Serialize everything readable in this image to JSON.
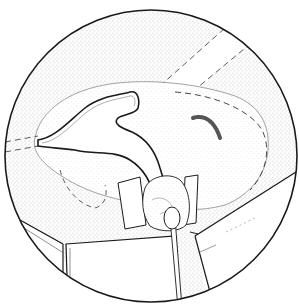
{
  "figure": {
    "type": "surgical-illustration",
    "style": "stippled line drawing in circular field",
    "colors": {
      "background": "#ffffff",
      "line": "#1a1a1a",
      "stipple": "#9a9a9a",
      "dark_mark": "#555555"
    },
    "elements": [
      "circular-view-border",
      "stippled-tissue-field",
      "dashed-band-upper-right",
      "y-shaped-structure",
      "dashed-outline-region",
      "dark-curved-mark",
      "bow-tie-clamp",
      "rounded-mass",
      "cotton-swab",
      "left-retractor",
      "right-retractor"
    ]
  }
}
